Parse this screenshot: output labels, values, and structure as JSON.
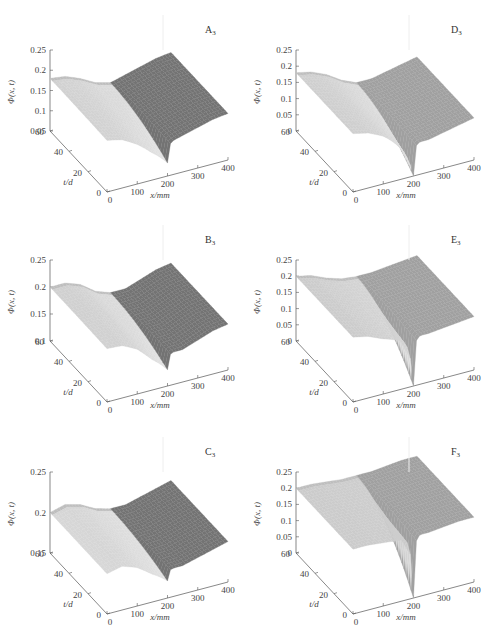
{
  "chart_data": [
    {
      "type": "surface3d",
      "panel": "A3",
      "label": "A",
      "label_sub": "3",
      "zlabel": "Φ(x, t)",
      "xlabel": "x/mm",
      "ylabel": "t/d",
      "zticks": [
        "0.25",
        "0.2",
        "0.15",
        "0.1",
        "0.05"
      ],
      "zlim": [
        0.05,
        0.25
      ],
      "xticks": [
        "0",
        "100",
        "200",
        "300",
        "400"
      ],
      "yticks": [
        "0",
        "20",
        "40",
        "60"
      ],
      "profile_t60": {
        "x": [
          0,
          50,
          100,
          150,
          200,
          250,
          300,
          350,
          400
        ],
        "phi": [
          0.18,
          0.175,
          0.16,
          0.14,
          0.13,
          0.14,
          0.15,
          0.16,
          0.165
        ]
      },
      "notes": "Surface drops sharply near x=200 toward low t; right region darker shading"
    },
    {
      "type": "surface3d",
      "panel": "B3",
      "label": "B",
      "label_sub": "3",
      "zlabel": "Φ(x, t)",
      "xlabel": "x/mm",
      "ylabel": "t/d",
      "zticks": [
        "0.25",
        "0.2",
        "0.15",
        "0.1"
      ],
      "zlim": [
        0.1,
        0.25
      ],
      "xticks": [
        "0",
        "100",
        "200",
        "300",
        "400"
      ],
      "yticks": [
        "0",
        "20",
        "40",
        "60"
      ],
      "profile_t60": {
        "x": [
          0,
          50,
          100,
          150,
          200,
          250,
          300,
          350,
          400
        ],
        "phi": [
          0.2,
          0.2,
          0.19,
          0.17,
          0.16,
          0.16,
          0.17,
          0.18,
          0.185
        ]
      },
      "notes": "Moderate drop near x=200 toward low t"
    },
    {
      "type": "surface3d",
      "panel": "C3",
      "label": "C",
      "label_sub": "3",
      "zlabel": "Φ(x, t)",
      "xlabel": "x/mm",
      "ylabel": "t/d",
      "zticks": [
        "0.25",
        "0.2",
        "0.15"
      ],
      "zlim": [
        0.15,
        0.25
      ],
      "xticks": [
        "0",
        "100",
        "200",
        "300",
        "400"
      ],
      "yticks": [
        "0",
        "20",
        "40",
        "60"
      ],
      "profile_t60": {
        "x": [
          0,
          50,
          100,
          150,
          200,
          250,
          300,
          350,
          400
        ],
        "phi": [
          0.2,
          0.205,
          0.2,
          0.19,
          0.185,
          0.185,
          0.19,
          0.195,
          0.2
        ]
      },
      "notes": "Smallest drop near x=200"
    },
    {
      "type": "surface3d",
      "panel": "D3",
      "label": "D",
      "label_sub": "3",
      "zlabel": "Φ(x, t)",
      "xlabel": "x/mm",
      "ylabel": "t/d",
      "zticks": [
        "0.25",
        "0.2",
        "0.15",
        "0.1",
        "0.05",
        "0"
      ],
      "zlim": [
        0,
        0.25
      ],
      "xticks": [
        "0",
        "100",
        "200",
        "300",
        "400"
      ],
      "yticks": [
        "0",
        "20",
        "40",
        "60"
      ],
      "profile_t60": {
        "x": [
          0,
          50,
          100,
          150,
          200,
          250,
          300,
          350,
          400
        ],
        "phi": [
          0.18,
          0.17,
          0.15,
          0.12,
          0.1,
          0.1,
          0.11,
          0.12,
          0.13
        ]
      },
      "notes": "Sharp spike down to ~0 at x=200, low t"
    },
    {
      "type": "surface3d",
      "panel": "E3",
      "label": "E",
      "label_sub": "3",
      "zlabel": "Φ(x, t)",
      "xlabel": "x/mm",
      "ylabel": "t/d",
      "zticks": [
        "0.25",
        "0.2",
        "0.15",
        "0.1",
        "0.05",
        "0"
      ],
      "zlim": [
        0,
        0.25
      ],
      "xticks": [
        "0",
        "100",
        "200",
        "300",
        "400"
      ],
      "yticks": [
        "0",
        "20",
        "40",
        "60"
      ],
      "profile_t60": {
        "x": [
          0,
          50,
          100,
          150,
          200,
          250,
          300,
          350,
          400
        ],
        "phi": [
          0.2,
          0.19,
          0.17,
          0.155,
          0.15,
          0.15,
          0.155,
          0.16,
          0.165
        ]
      },
      "notes": "Narrow spike to ~0 at x=200"
    },
    {
      "type": "surface3d",
      "panel": "F3",
      "label": "F",
      "label_sub": "3",
      "zlabel": "Φ(x, t)",
      "xlabel": "x/mm",
      "ylabel": "t/d",
      "zticks": [
        "0.25",
        "0.2",
        "0.15",
        "0.1",
        "0.05",
        "0"
      ],
      "zlim": [
        0,
        0.25
      ],
      "xticks": [
        "0",
        "100",
        "200",
        "300",
        "400"
      ],
      "yticks": [
        "0",
        "20",
        "40",
        "60"
      ],
      "profile_t60": {
        "x": [
          0,
          50,
          100,
          150,
          200,
          250,
          300,
          350,
          400
        ],
        "phi": [
          0.2,
          0.2,
          0.195,
          0.19,
          0.19,
          0.19,
          0.195,
          0.2,
          0.2
        ]
      },
      "notes": "Nearly flat with a narrow spike to ~0 at x=200"
    }
  ]
}
